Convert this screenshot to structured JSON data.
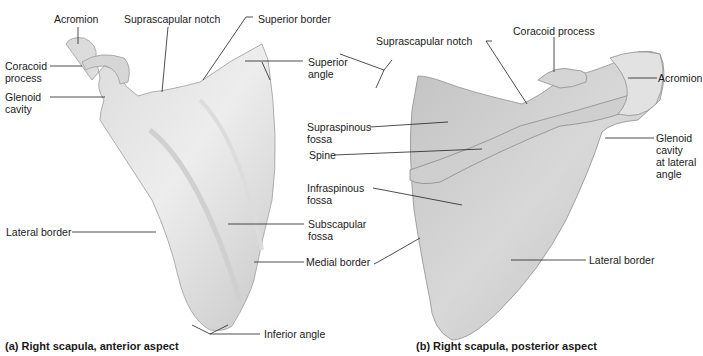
{
  "figure": {
    "panel_a": {
      "caption": "(a)  Right scapula, anterior aspect",
      "labels": {
        "acromion": "Acromion",
        "suprascapular_notch": "Suprascapular notch",
        "superior_border": "Superior border",
        "coracoid_1": "Coracoid",
        "coracoid_2": "process",
        "glenoid_1": "Glenoid",
        "glenoid_2": "cavity",
        "superior_angle_1": "Superior",
        "superior_angle_2": "angle",
        "lateral_border": "Lateral border",
        "subscapular_1": "Subscapular",
        "subscapular_2": "fossa",
        "medial_border": "Medial border",
        "inferior_angle": "Inferior angle"
      }
    },
    "panel_b": {
      "caption": "(b)  Right scapula, posterior aspect",
      "labels": {
        "suprascapular_notch": "Suprascapular notch",
        "coracoid_process": "Coracoid process",
        "acromion": "Acromion",
        "supraspinous_1": "Supraspinous",
        "supraspinous_2": "fossa",
        "spine": "Spine",
        "infraspinous_1": "Infraspinous",
        "infraspinous_2": "fossa",
        "glenoid_1": "Glenoid",
        "glenoid_2": "cavity",
        "glenoid_3": "at lateral",
        "glenoid_4": "angle",
        "lateral_border": "Lateral border"
      }
    },
    "colors": {
      "bone_light": "#ececec",
      "bone_mid": "#cfcfcf",
      "bone_dark": "#a9a9a9",
      "leader": "#222222"
    }
  }
}
